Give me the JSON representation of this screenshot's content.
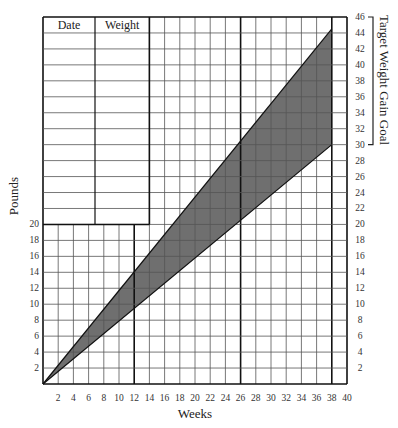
{
  "chart_data": {
    "type": "area",
    "title": "",
    "xlabel": "Weeks",
    "ylabel": "Pounds",
    "secondary_ylabel": "Target Weight Gain Goal",
    "xlim": [
      0,
      40
    ],
    "ylim": [
      0,
      46
    ],
    "x_ticks": [
      2,
      4,
      6,
      8,
      10,
      12,
      14,
      16,
      18,
      20,
      22,
      24,
      26,
      28,
      30,
      32,
      34,
      36,
      38,
      40
    ],
    "left_y_ticks": [
      2,
      4,
      6,
      8,
      10,
      12,
      14,
      16,
      18,
      20
    ],
    "right_y_ticks": [
      2,
      4,
      6,
      8,
      10,
      12,
      14,
      16,
      18,
      20,
      22,
      24,
      26,
      28,
      30,
      32,
      34,
      36,
      38,
      40,
      42,
      44,
      46
    ],
    "grid": true,
    "grid_step": {
      "x": 2,
      "y": 2
    },
    "emphasized_week_lines": [
      12,
      26,
      38
    ],
    "target_bracket": {
      "from": 30,
      "to": 46
    },
    "series": [
      {
        "name": "Upper bound",
        "x": [
          0,
          38
        ],
        "y": [
          0,
          44.5
        ]
      },
      {
        "name": "Lower bound",
        "x": [
          0,
          38
        ],
        "y": [
          0,
          30
        ]
      }
    ],
    "shaded_region": {
      "between": [
        "Upper bound",
        "Lower bound"
      ],
      "color": "#6f6f6f"
    }
  },
  "log_table": {
    "columns": [
      "Date",
      "Weight"
    ],
    "empty_rows": 12
  },
  "colors": {
    "shade": "#6f6f6f",
    "grid_thin": "#555555",
    "grid_thick": "#111111"
  }
}
